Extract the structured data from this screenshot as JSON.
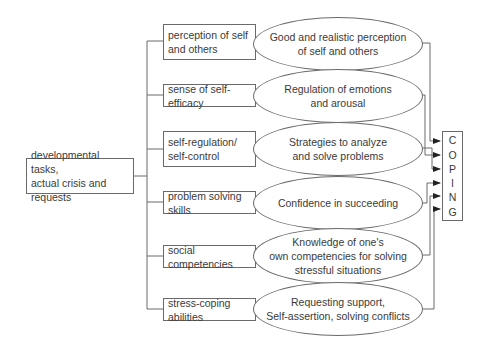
{
  "source": {
    "label": "developmental tasks,\nactual crisis and requests"
  },
  "resources": [
    {
      "label": "perception of self\nand others"
    },
    {
      "label": "sense of self-efficacy"
    },
    {
      "label": "self-regulation/\nself-control"
    },
    {
      "label": "problem solving skills"
    },
    {
      "label": "social competencies"
    },
    {
      "label": "stress-coping abilities"
    }
  ],
  "outcomes": [
    {
      "label": "Good and realistic perception\nof self and others"
    },
    {
      "label": "Regulation of emotions\nand arousal"
    },
    {
      "label": "Strategies to analyze\nand solve problems"
    },
    {
      "label": "Confidence in succeeding"
    },
    {
      "label": "Knowledge of one's\nown competencies for solving\nstressful situations"
    },
    {
      "label": "Requesting support,\nSelf-assertion, solving conflicts"
    }
  ],
  "target": {
    "letters": [
      "C",
      "O",
      "P",
      "I",
      "N",
      "G"
    ]
  },
  "colors": {
    "line": "#6a6a6a",
    "text": "#3a3a3a"
  }
}
